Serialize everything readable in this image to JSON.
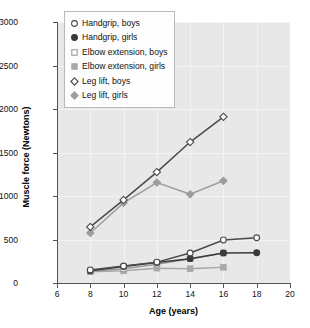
{
  "chart_data": {
    "type": "line",
    "title": "",
    "xlabel": "Age (years)",
    "ylabel": "Muscle force (Newtons)",
    "xlim": [
      6,
      20
    ],
    "ylim": [
      0,
      3000
    ],
    "xticks": [
      6,
      8,
      10,
      12,
      14,
      16,
      18,
      20
    ],
    "yticks": [
      0,
      500,
      1000,
      1500,
      2000,
      2500,
      3000
    ],
    "grid": true,
    "legend_position": "top-left",
    "series": [
      {
        "name": "Handgrip, boys",
        "marker": "open-circle",
        "color": "#4a4a4a",
        "x": [
          8,
          10,
          12,
          14,
          16,
          18
        ],
        "values": [
          150,
          195,
          240,
          345,
          495,
          520
        ]
      },
      {
        "name": "Handgrip, girls",
        "marker": "filled-circle",
        "color": "#3a3a3a",
        "x": [
          8,
          10,
          12,
          14,
          16,
          18
        ],
        "values": [
          140,
          190,
          235,
          280,
          345,
          348
        ]
      },
      {
        "name": "Elbow extension, boys",
        "marker": "open-square",
        "color": "#9a9a9a",
        "x": [
          8,
          10,
          12,
          14,
          16
        ],
        "values": [
          135,
          165,
          215,
          280,
          345
        ]
      },
      {
        "name": "Elbow extension, girls",
        "marker": "filled-square",
        "color": "#a9a9a9",
        "x": [
          8,
          10,
          12,
          14,
          16
        ],
        "values": [
          130,
          140,
          170,
          165,
          180
        ]
      },
      {
        "name": "Leg lift, boys",
        "marker": "open-diamond",
        "color": "#4a4a4a",
        "x": [
          8,
          10,
          12,
          14,
          16
        ],
        "values": [
          645,
          955,
          1275,
          1620,
          1910
        ]
      },
      {
        "name": "Leg lift, girls",
        "marker": "filled-diamond",
        "color": "#9d9d9d",
        "x": [
          8,
          10,
          12,
          14,
          16
        ],
        "values": [
          575,
          920,
          1155,
          1020,
          1175
        ]
      }
    ]
  },
  "legend": {
    "items": [
      {
        "label": "Handgrip, boys"
      },
      {
        "label": "Handgrip, girls"
      },
      {
        "label": "Elbow extension, boys"
      },
      {
        "label": "Elbow extension, girls"
      },
      {
        "label": "Leg lift, boys"
      },
      {
        "label": "Leg lift, girls"
      }
    ]
  },
  "axes": {
    "x_title": "Age (years)",
    "y_title": "Muscle force (Newtons)",
    "x_tick_labels": [
      "6",
      "8",
      "10",
      "12",
      "14",
      "16",
      "18",
      "20"
    ],
    "y_tick_labels": [
      "0",
      "500",
      "1000",
      "1500",
      "2000",
      "2500",
      "3000"
    ]
  }
}
